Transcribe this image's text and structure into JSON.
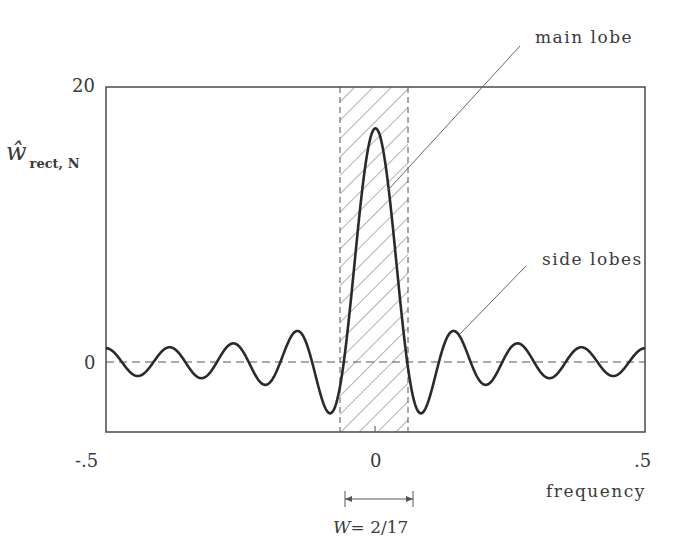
{
  "chart_data": {
    "type": "line",
    "title": "",
    "xlabel": "frequency",
    "ylabel": "ŵ rect, N",
    "ylabel_main": "ŵ",
    "ylabel_sub": "rect, N",
    "xlim": [
      -0.5,
      0.5
    ],
    "ylim": [
      -5,
      20
    ],
    "x_ticks": [
      "-.5",
      "0",
      ".5"
    ],
    "y_ticks": [
      "0",
      "20"
    ],
    "grid": false,
    "legend": null,
    "N": 17,
    "series": [
      {
        "name": "Dirichlet kernel (rectangular window spectrum), N=17",
        "formula": "sin(pi*f*N)/sin(pi*f)",
        "x": [
          -0.5,
          -0.45,
          -0.4,
          -0.35,
          -0.3,
          -0.25,
          -0.2,
          -0.15,
          -0.1,
          -0.075,
          -0.05,
          -0.025,
          0,
          0.025,
          0.05,
          0.075,
          0.1,
          0.15,
          0.2,
          0.25,
          0.3,
          0.35,
          0.4,
          0.45,
          0.5
        ],
        "values": [
          1.0,
          -1.2,
          1.2,
          -1.4,
          1.6,
          -1.4,
          1.6,
          -2.5,
          -3.6,
          -2.0,
          6.5,
          14.6,
          17.0,
          14.6,
          6.5,
          -2.0,
          -3.6,
          -2.5,
          1.6,
          -1.4,
          1.6,
          -1.4,
          1.2,
          -1.2,
          1.0
        ]
      }
    ],
    "shaded_band": {
      "x0": -0.0588,
      "x1": 0.0588,
      "pattern": "diagonal hatch",
      "label": "main lobe"
    },
    "reference_line": {
      "y": 0,
      "style": "dashed"
    },
    "annotations": [
      {
        "text": "main lobe",
        "points_to": [
          0.03,
          10
        ]
      },
      {
        "text": "side lobes",
        "points_to": [
          0.15,
          3.7
        ]
      },
      {
        "text": "W = 2/17",
        "type": "width-bracket",
        "x0": -0.0588,
        "x1": 0.0588
      }
    ]
  },
  "labels": {
    "y_top": "20",
    "y_zero": "0",
    "x_left": "-.5",
    "x_mid": "0",
    "x_right": ".5",
    "xlabel": "frequency",
    "ylabel_hat": "ŵ",
    "ylabel_sub": "rect, N",
    "main_lobe": "main lobe",
    "side_lobes": "side lobes",
    "bandwidth": "W = 2/17",
    "bandwidth_W": "W",
    "bandwidth_eq": "= 2/17"
  },
  "colors": {
    "curve": "#2a2a2a",
    "frame": "#4a4a4a",
    "hatch": "#555555",
    "text": "#3a3a3a"
  }
}
